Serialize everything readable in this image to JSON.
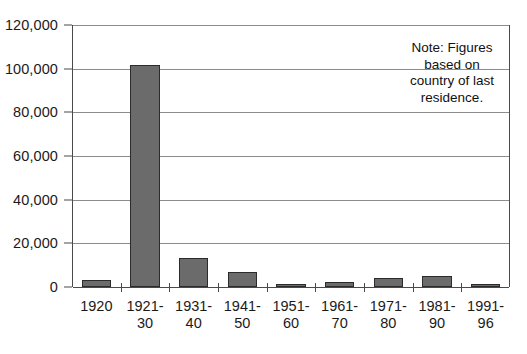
{
  "chart_data": {
    "type": "bar",
    "title": "",
    "subtitle": "",
    "xlabel": "",
    "ylabel": "",
    "grid": true,
    "legend": false,
    "ylim": [
      0,
      120000
    ],
    "ytick_values": [
      120000,
      100000,
      80000,
      60000,
      40000,
      20000,
      0
    ],
    "ytick_labels": [
      "120,000",
      "100,000",
      "80,000",
      "60,000",
      "40,000",
      "20,000",
      "0"
    ],
    "categories": [
      "1920",
      "1921-\n30",
      "1931-\n40",
      "1941-\n50",
      "1951-\n60",
      "1961-\n70",
      "1971-\n80",
      "1981-\n90",
      "1991-\n96"
    ],
    "values": [
      3200,
      101500,
      13300,
      7000,
      900,
      2300,
      4100,
      5000,
      1300
    ],
    "series": [
      {
        "name": "Immigration",
        "values": [
          3200,
          101500,
          13300,
          7000,
          900,
          2300,
          4100,
          5000,
          1300
        ]
      }
    ],
    "annotations": [
      {
        "name": "note",
        "text": "Note: Figures based on country of last residence."
      }
    ]
  },
  "note": {
    "lines": [
      "Note: Figures",
      "based on",
      "country of last",
      "residence."
    ],
    "text": "Note: Figures based on country of last residence."
  },
  "colors": {
    "bar_fill": "#6b6b6b",
    "bar_stroke": "#2b2b2b",
    "gridline": "#8c8c8c",
    "axis": "#4a4a4a",
    "text": "#1a1a1a",
    "background": "#ffffff"
  }
}
